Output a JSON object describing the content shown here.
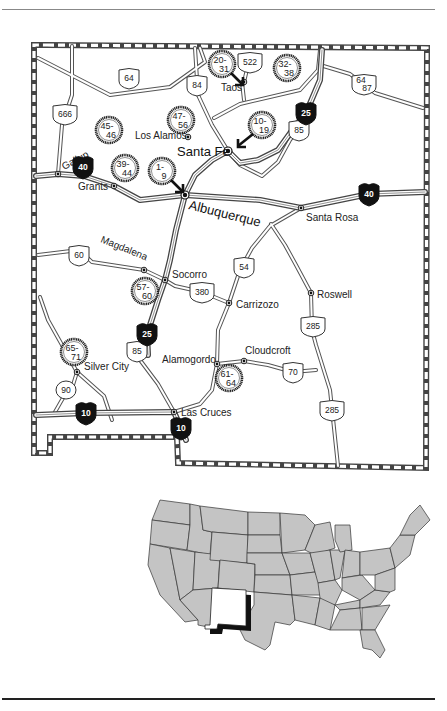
{
  "map": {
    "title": "New Mexico",
    "cities": [
      {
        "name": "Gallup",
        "x": 58,
        "y": 174,
        "lx": 64,
        "ly": 170,
        "rot": -28
      },
      {
        "name": "Grants",
        "x": 114,
        "y": 186,
        "lx": 78,
        "ly": 190,
        "rot": 0
      },
      {
        "name": "Los Alamos",
        "x": 188,
        "y": 137,
        "lx": 135,
        "ly": 139,
        "rot": 0
      },
      {
        "name": "Taos",
        "x": 244,
        "y": 82,
        "lx": 221,
        "ly": 91,
        "rot": 0
      },
      {
        "name": "Socorro",
        "x": 165,
        "y": 280,
        "lx": 172,
        "ly": 278,
        "rot": 0
      },
      {
        "name": "Magdalena",
        "x": 144,
        "y": 270,
        "lx": 100,
        "ly": 242,
        "rot": 22
      },
      {
        "name": "Santa Rosa",
        "x": 301,
        "y": 208,
        "lx": 306,
        "ly": 221,
        "rot": 0
      },
      {
        "name": "Carrizozo",
        "x": 229,
        "y": 303,
        "lx": 236,
        "ly": 308,
        "rot": 0
      },
      {
        "name": "Roswell",
        "x": 311,
        "y": 293,
        "lx": 317,
        "ly": 298,
        "rot": 0
      },
      {
        "name": "Cloudcroft",
        "x": 244,
        "y": 361,
        "lx": 245,
        "ly": 354,
        "rot": 0
      },
      {
        "name": "Alamogordo",
        "x": 217,
        "y": 364,
        "lx": 162,
        "ly": 363,
        "rot": 0
      },
      {
        "name": "Silver City",
        "x": 77,
        "y": 372,
        "lx": 84,
        "ly": 370,
        "rot": 0
      },
      {
        "name": "Las Cruces",
        "x": 174,
        "y": 412,
        "lx": 181,
        "ly": 416,
        "rot": 0
      }
    ],
    "major_cities": [
      {
        "name": "Santa Fe",
        "x": 228,
        "y": 151,
        "lx": 177,
        "ly": 156,
        "rot": 0
      },
      {
        "name": "Albuquerque",
        "x": 185,
        "y": 195,
        "lx": 188,
        "ly": 209,
        "rot": 14
      }
    ],
    "us_shields": [
      {
        "label": "64",
        "x": 129,
        "y": 78
      },
      {
        "label": "84",
        "x": 197,
        "y": 85
      },
      {
        "label": "522",
        "x": 250,
        "y": 62
      },
      {
        "label": "666",
        "x": 65,
        "y": 114
      },
      {
        "label": "85",
        "x": 299,
        "y": 130
      },
      {
        "label": "60",
        "x": 79,
        "y": 255
      },
      {
        "label": "380",
        "x": 202,
        "y": 292
      },
      {
        "label": "54",
        "x": 244,
        "y": 267
      },
      {
        "label": "285",
        "x": 313,
        "y": 326
      },
      {
        "label": "85",
        "x": 137,
        "y": 351
      },
      {
        "label": "70",
        "x": 293,
        "y": 372
      },
      {
        "label": "285",
        "x": 332,
        "y": 410
      },
      {
        "label": "64 87",
        "x": 364,
        "y": 84
      }
    ],
    "state_shields": [
      {
        "label": "90",
        "x": 66,
        "y": 390
      }
    ],
    "interstate_shields": [
      {
        "label": "40",
        "x": 83,
        "y": 167
      },
      {
        "label": "25",
        "x": 306,
        "y": 113
      },
      {
        "label": "40",
        "x": 369,
        "y": 194
      },
      {
        "label": "25",
        "x": 147,
        "y": 334
      },
      {
        "label": "10",
        "x": 86,
        "y": 413
      },
      {
        "label": "10",
        "x": 181,
        "y": 428
      }
    ],
    "site_markers": [
      {
        "top": "20-",
        "bottom": "31",
        "x": 222,
        "y": 64,
        "arrow": "se"
      },
      {
        "top": "32-",
        "bottom": "38",
        "x": 287,
        "y": 68,
        "arrow": ""
      },
      {
        "top": "47-",
        "bottom": "56",
        "x": 181,
        "y": 120,
        "arrow": ""
      },
      {
        "top": "45-",
        "bottom": "46",
        "x": 109,
        "y": 130,
        "arrow": ""
      },
      {
        "top": "10-",
        "bottom": "19",
        "x": 262,
        "y": 125,
        "arrow": "sw"
      },
      {
        "top": "39-",
        "bottom": "44",
        "x": 125,
        "y": 168,
        "arrow": ""
      },
      {
        "top": "1-",
        "bottom": "9",
        "x": 162,
        "y": 171,
        "arrow": "se"
      },
      {
        "top": "57-",
        "bottom": "60",
        "x": 145,
        "y": 291,
        "arrow": ""
      },
      {
        "top": "65-",
        "bottom": "71",
        "x": 74,
        "y": 352,
        "arrow": ""
      },
      {
        "top": "61-",
        "bottom": "64",
        "x": 229,
        "y": 378,
        "arrow": ""
      }
    ]
  },
  "inset": {
    "title": "United States",
    "highlighted_state": "New Mexico"
  },
  "colors": {
    "land": "#c4c4c4",
    "highlight": "#ffffff",
    "ink": "#222222",
    "interstate": "#111111"
  }
}
